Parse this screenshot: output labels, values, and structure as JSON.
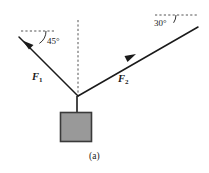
{
  "figure": {
    "caption": "(a)",
    "colors": {
      "stroke": "#1a1a1a",
      "block_fill": "#999999",
      "block_stroke": "#3a3a3a",
      "dashed": "#555555",
      "background": "#ffffff"
    }
  },
  "labels": {
    "angle_left": "45°",
    "angle_right": "30°",
    "force_left_name": "F",
    "force_left_sub": "1",
    "force_right_name": "F",
    "force_right_sub": "2"
  },
  "diagram_data": {
    "type": "free-body-diagram",
    "description": "A block hangs from a knot supported by two cables making angles with the horizontal",
    "knot": {
      "x": 78,
      "y": 96
    },
    "cables": [
      {
        "name": "F1",
        "label": "F₁",
        "angle_deg": 45,
        "angle_label": "45°",
        "direction": "up-left",
        "start": {
          "x": 78,
          "y": 96
        },
        "end": {
          "x": 19,
          "y": 37
        },
        "arrow_at": {
          "x": 27,
          "y": 45
        },
        "reference_dashed_line": {
          "x1": 21,
          "y1": 31,
          "x2": 55,
          "y2": 31
        }
      },
      {
        "name": "F2",
        "label": "F₂",
        "angle_deg": 30,
        "angle_label": "30°",
        "direction": "up-right",
        "start": {
          "x": 78,
          "y": 96
        },
        "end": {
          "x": 198,
          "y": 27
        },
        "arrow_at": {
          "x": 131,
          "y": 58
        },
        "reference_dashed_line": {
          "x1": 155,
          "y1": 15,
          "x2": 199,
          "y2": 15
        }
      }
    ],
    "vertical_reference": {
      "x": 78,
      "y_top": 20,
      "y_bottom": 96,
      "style": "dashed"
    },
    "hanger": {
      "x": 77,
      "y_top": 96,
      "y_bottom": 112
    },
    "block": {
      "x": 60,
      "y": 112,
      "width": 32,
      "height": 30,
      "fill": "#999999"
    }
  }
}
